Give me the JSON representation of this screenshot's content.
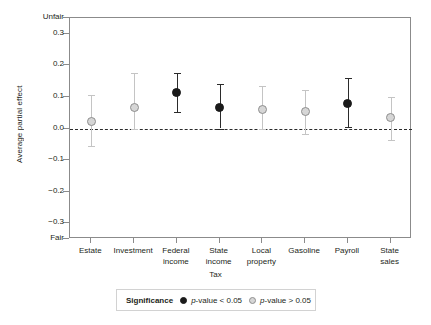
{
  "chart_data": {
    "type": "scatter",
    "title": "",
    "xlabel": "Tax",
    "ylabel": "Average partial effect",
    "ylim": [
      -0.35,
      0.35
    ],
    "grid": false,
    "zero_reference_line": 0.0,
    "y_tick_values": [
      0.3,
      0.2,
      0.1,
      0.0,
      -0.1,
      -0.2,
      -0.3
    ],
    "y_tick_labels": [
      "0.3",
      "0.2",
      "0.1",
      "0.0",
      "−0.1",
      "−0.2",
      "−0.3"
    ],
    "y_axis_endpoint_top_label": "Unfair",
    "y_axis_endpoint_bottom_label": "Fair",
    "categories": [
      "Estate",
      "Investment",
      "Federal income",
      "State income",
      "Local property",
      "Gasoline",
      "Payroll",
      "State sales"
    ],
    "category_lines": [
      [
        "Estate"
      ],
      [
        "Investment"
      ],
      [
        "Federal",
        "income"
      ],
      [
        "State",
        "income"
      ],
      [
        "Local",
        "property"
      ],
      [
        "Gasoline"
      ],
      [
        "Payroll"
      ],
      [
        "State",
        "sales"
      ]
    ],
    "values": [
      0.022,
      0.068,
      0.115,
      0.066,
      0.06,
      0.053,
      0.078,
      0.035
    ],
    "ci_low": [
      -0.057,
      -0.001,
      0.053,
      0.0,
      -0.002,
      -0.019,
      0.004,
      -0.037
    ],
    "ci_high": [
      0.105,
      0.175,
      0.175,
      0.14,
      0.134,
      0.123,
      0.16,
      0.1
    ],
    "significance": [
      "p-value > 0.05",
      "p-value > 0.05",
      "p-value < 0.05",
      "p-value < 0.05",
      "p-value > 0.05",
      "p-value > 0.05",
      "p-value < 0.05",
      "p-value > 0.05"
    ],
    "significant_flags": [
      false,
      false,
      true,
      true,
      false,
      false,
      true,
      false
    ],
    "colors": {
      "significant_marker": "#1a1a1a",
      "nonsignificant_marker": "#d6d6d6",
      "nonsignificant_marker_edge": "#8e8e8e",
      "significant_errorbar": "#2b2b2b",
      "nonsignificant_errorbar": "#c4c4c4",
      "axis": "#8b8b8b",
      "zero_line": "#2b2b2b",
      "text": "#231f20"
    }
  },
  "legend": {
    "title": "Significance",
    "position": "bottom-center",
    "entries": [
      {
        "marker": "filled-dot",
        "label_prefix": "p",
        "label_rest": "-value < 0.05"
      },
      {
        "marker": "open-gray-dot",
        "label_prefix": "p",
        "label_rest": "-value > 0.05"
      }
    ]
  }
}
